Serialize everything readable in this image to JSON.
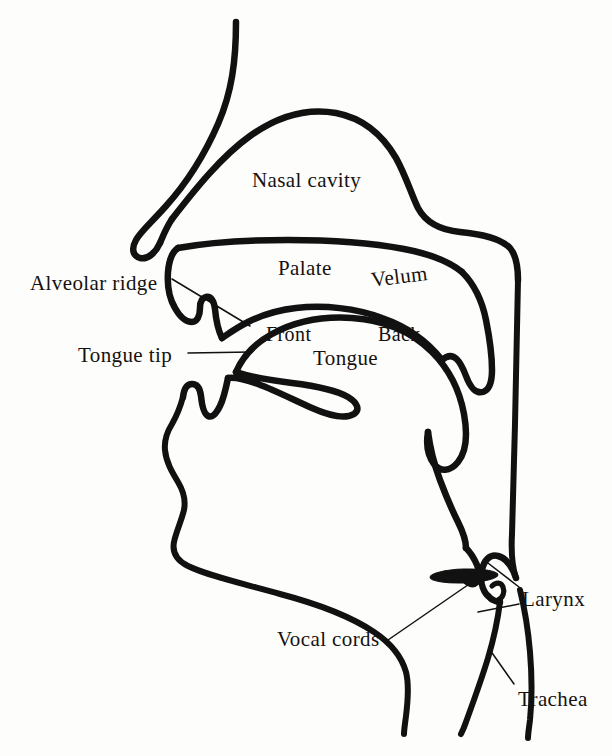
{
  "figure": {
    "type": "anatomical-line-diagram",
    "background_color": "#fdfdfb",
    "ink_color": "#111111"
  },
  "labels": {
    "nasal_cavity": "Nasal cavity",
    "alveolar_ridge": "Alveolar ridge",
    "palate": "Palate",
    "velum": "Velum",
    "tongue_tip": "Tongue tip",
    "front": "Front",
    "back": "Back",
    "tongue": "Tongue",
    "vocal_cords": "Vocal cords",
    "larynx": "Larynx",
    "trachea": "Trachea"
  },
  "annotations": [
    {
      "name": "nasal-cavity",
      "text": "Nasal cavity",
      "x": 252,
      "y": 170,
      "leader": false
    },
    {
      "name": "alveolar-ridge",
      "text": "Alveolar ridge",
      "x": 30,
      "y": 273,
      "leader": true
    },
    {
      "name": "palate",
      "text": "Palate",
      "x": 278,
      "y": 258,
      "leader": false
    },
    {
      "name": "velum",
      "text": "Velum",
      "x": 372,
      "y": 270,
      "leader": false
    },
    {
      "name": "tongue-tip",
      "text": "Tongue tip",
      "x": 78,
      "y": 345,
      "leader": true
    },
    {
      "name": "front",
      "text": "Front",
      "x": 266,
      "y": 324,
      "leader": false
    },
    {
      "name": "back",
      "text": "Back",
      "x": 378,
      "y": 324,
      "leader": false
    },
    {
      "name": "tongue",
      "text": "Tongue",
      "x": 313,
      "y": 348,
      "leader": false
    },
    {
      "name": "vocal-cords",
      "text": "Vocal cords",
      "x": 277,
      "y": 629,
      "leader": true
    },
    {
      "name": "larynx",
      "text": "Larynx",
      "x": 522,
      "y": 589,
      "leader": true
    },
    {
      "name": "trachea",
      "text": "Trachea",
      "x": 518,
      "y": 689,
      "leader": true
    }
  ]
}
